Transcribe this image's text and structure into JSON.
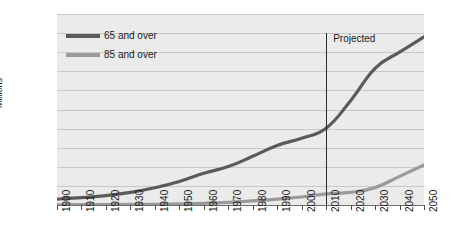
{
  "chart_data": {
    "type": "line",
    "title": "",
    "xlabel": "",
    "ylabel": "Millions",
    "xlim": [
      1900,
      2050
    ],
    "ylim": [
      0,
      100
    ],
    "ytick_step": 10,
    "xtick_step": 10,
    "grid": true,
    "legend_position": "top-left",
    "x": [
      1900,
      1910,
      1920,
      1930,
      1940,
      1950,
      1960,
      1970,
      1980,
      1990,
      2000,
      2010,
      2020,
      2030,
      2040,
      2050
    ],
    "ytick_labels": [
      "0",
      "10",
      "20",
      "30",
      "40",
      "50",
      "60",
      "70",
      "80",
      "90",
      "100"
    ],
    "ytick_values": [
      0,
      10,
      20,
      30,
      40,
      50,
      60,
      70,
      80,
      90,
      100
    ],
    "xtick_labels": [
      "1900",
      "1910",
      "1920",
      "1930",
      "1940",
      "1950",
      "1960",
      "1970",
      "1980",
      "1990",
      "2000",
      "2010",
      "2020",
      "2030",
      "2040",
      "2050"
    ],
    "series": [
      {
        "name": "65 and over",
        "color": "#5a5a5a",
        "values": [
          3.1,
          3.9,
          4.9,
          6.6,
          9.0,
          12.3,
          16.6,
          20.1,
          25.5,
          31.2,
          35.0,
          40.2,
          54.6,
          71.5,
          80.0,
          88.0
        ]
      },
      {
        "name": "85 and over",
        "color": "#9a9a9a",
        "values": [
          0.1,
          0.2,
          0.2,
          0.3,
          0.4,
          0.6,
          0.9,
          1.4,
          2.2,
          3.1,
          4.2,
          5.8,
          6.6,
          9.1,
          15.0,
          21.0
        ]
      }
    ],
    "annotations": [
      {
        "text": "Projected",
        "x": 2010,
        "note": "vertical divider separating actual from projected data"
      }
    ]
  },
  "legend": {
    "items": [
      {
        "label": "65 and over",
        "color": "#5a5a5a"
      },
      {
        "label": "85 and over",
        "color": "#9a9a9a"
      }
    ]
  },
  "annotation": {
    "projected_label": "Projected"
  },
  "axes": {
    "y_title": "Millions"
  },
  "colors": {
    "plot_background": "#ebebeb",
    "gridline": "#c9c9c9",
    "axis": "#6e6e6e",
    "divider": "#2b2b2b",
    "text": "#1a1a1a"
  }
}
